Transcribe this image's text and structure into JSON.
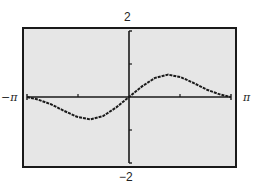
{
  "chart_data": {
    "type": "line",
    "title": "",
    "xlabel": "",
    "ylabel": "",
    "xlim": [
      "-π",
      "π"
    ],
    "xlim_numeric": [
      -3.14159,
      3.14159
    ],
    "ylim": [
      -2,
      2
    ],
    "x_tick_labels": {
      "min": "−π",
      "max": "π"
    },
    "y_tick_labels": {
      "max": "2",
      "min": "−2"
    },
    "x_ticks": [
      -1.5708,
      1.5708
    ],
    "y_ticks": [
      -1,
      1
    ],
    "grid": false,
    "legend": null,
    "series": [
      {
        "name": "f(x)",
        "x": [
          -3.14,
          -2.8,
          -2.4,
          -2.0,
          -1.6,
          -1.2,
          -0.8,
          -0.4,
          0.0,
          0.4,
          0.8,
          1.2,
          1.6,
          2.0,
          2.4,
          2.8,
          3.14
        ],
        "y": [
          0.0,
          -0.08,
          -0.22,
          -0.42,
          -0.6,
          -0.68,
          -0.58,
          -0.32,
          0.0,
          0.32,
          0.58,
          0.68,
          0.6,
          0.42,
          0.22,
          0.08,
          0.0
        ]
      }
    ]
  },
  "labels": {
    "y_max": "2",
    "y_min": "−2",
    "x_min": "−π",
    "x_max": "π"
  },
  "colors": {
    "plot_background": "#e6e6e6",
    "frame": "#1a1a1a",
    "curve": "#1a1a1a"
  }
}
